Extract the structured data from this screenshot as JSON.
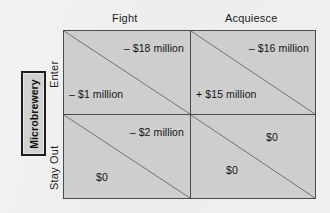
{
  "figure": {
    "kind": "payoff-matrix",
    "row_player": "Microbrewery",
    "fill_color": "#cfcece",
    "line_color": "#4a4a4a",
    "text_color": "#131313"
  },
  "columns": [
    {
      "label": "Fight"
    },
    {
      "label": "Acquiesce"
    }
  ],
  "rows": [
    {
      "label": "Enter"
    },
    {
      "label": "Stay Out"
    }
  ],
  "cells": [
    {
      "row": "Enter",
      "column": "Fight",
      "upper_right": "– $18 million",
      "lower_left": "– $1 million"
    },
    {
      "row": "Enter",
      "column": "Acquiesce",
      "upper_right": "– $16 million",
      "lower_left": "+ $15 million"
    },
    {
      "row": "Stay Out",
      "column": "Fight",
      "upper_right": "– $2 million",
      "lower_left": "$0"
    },
    {
      "row": "Stay Out",
      "column": "Acquiesce",
      "upper_right": "$0",
      "lower_left": "$0"
    }
  ]
}
